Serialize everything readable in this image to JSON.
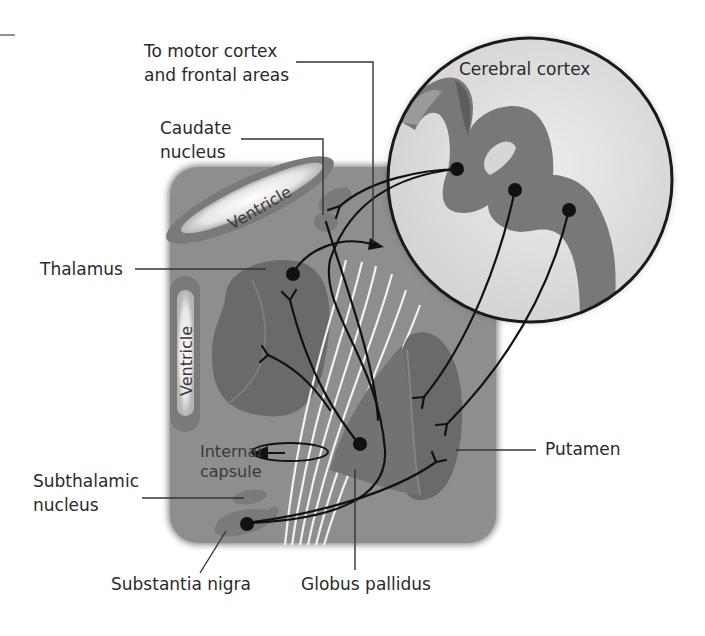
{
  "labels": {
    "motor_cortex_line1": "To motor cortex",
    "motor_cortex_line2": "and frontal areas",
    "caudate_line1": "Caudate",
    "caudate_line2": "nucleus",
    "thalamus": "Thalamus",
    "subthalamic_line1": "Subthalamic",
    "subthalamic_line2": "nucleus",
    "substantia_nigra": "Substantia nigra",
    "globus_pallidus": "Globus pallidus",
    "putamen": "Putamen",
    "cerebral_cortex": "Cerebral cortex",
    "ventricle_upper": "Ventricle",
    "ventricle_left": "Ventricle",
    "internal_capsule_line1": "Internal",
    "internal_capsule_line2": "capsule"
  },
  "colors": {
    "background": "#ffffff",
    "brain_section": "#8e8e8e",
    "nucleus_dark": "#6a6a6a",
    "ventricle_fill": "#f2f2f2",
    "cortex_bg": "#dcdcdc",
    "cortex_gray_matter": "#777777",
    "pathway": "#111111",
    "fibers": "#f2f2f2"
  }
}
